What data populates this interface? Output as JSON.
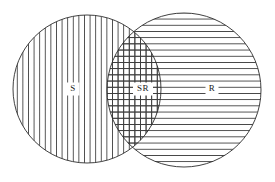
{
  "figure": {
    "type": "venn-diagram",
    "title": "",
    "background_color": "#ffffff",
    "outline_color": "#2b2b2b",
    "hatch_color": "#3c3c3c",
    "label_color": "#1a1a1a",
    "width": 275,
    "height": 182
  },
  "sets": [
    {
      "id": "S",
      "label": "S",
      "hatch": "vertical",
      "hatch_spacing": 5.6,
      "center_x": 87,
      "center_y": 89,
      "radius": 74,
      "label_x": 73,
      "label_y": 89
    },
    {
      "id": "R",
      "label": "R",
      "hatch": "horizontal",
      "hatch_spacing": 6.2,
      "center_x": 184,
      "center_y": 90,
      "radius": 77,
      "label_x": 212,
      "label_y": 89
    }
  ],
  "intersection": {
    "id": "SR",
    "label": "SR",
    "hatch": "crosshatch",
    "label_x": 143,
    "label_y": 89
  }
}
